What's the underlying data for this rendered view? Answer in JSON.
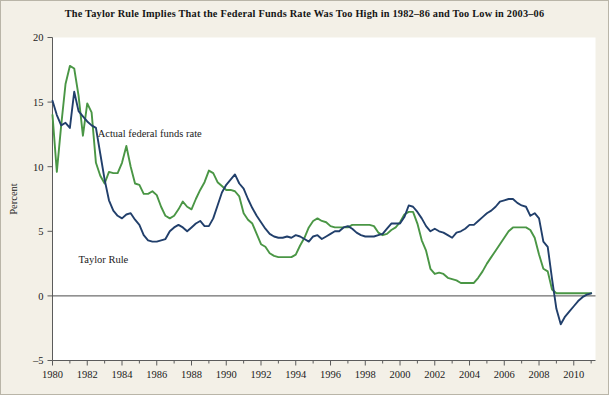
{
  "chart_data": {
    "type": "line",
    "title": "The Taylor Rule Implies That the Federal Funds Rate Was Too High in 1982–86 and Too Low in 2003–06",
    "xlabel": "",
    "ylabel": "Percent",
    "xlim": [
      1980,
      2011.25
    ],
    "ylim": [
      -5,
      20
    ],
    "ytick_values": [
      -5,
      0,
      5,
      10,
      15,
      20
    ],
    "ytick_labels": [
      "–5",
      "0",
      "5",
      "10",
      "15",
      "20"
    ],
    "xtick_values": [
      1980,
      1982,
      1984,
      1986,
      1988,
      1990,
      1992,
      1994,
      1996,
      1998,
      2000,
      2002,
      2004,
      2006,
      2008,
      2010
    ],
    "xtick_labels": [
      "1980",
      "1982",
      "1984",
      "1986",
      "1988",
      "1990",
      "1992",
      "1994",
      "1996",
      "1998",
      "2000",
      "2002",
      "2004",
      "2006",
      "2008",
      "2010"
    ],
    "x_minor_step": 1,
    "grid": false,
    "legend": "inline-annotations",
    "zero_line": true,
    "colors": {
      "actual_federal_funds_rate": "#4a9645",
      "taylor_rule": "#213f6b",
      "axis": "#5b5b5b",
      "background": "#f3f0e7",
      "plot_background": "#ffffff",
      "text": "#1b1b1b"
    },
    "annotations": [
      {
        "name": "actual-series-label",
        "text": "Actual federal funds rate",
        "x": 1982.6,
        "y": 12.3
      },
      {
        "name": "taylor-series-label",
        "text": "Taylor Rule",
        "x": 1981.5,
        "y": 2.55
      }
    ],
    "series": [
      {
        "name": "Actual federal funds rate",
        "color": "#4a9645",
        "x": [
          1980.0,
          1980.25,
          1980.5,
          1980.75,
          1981.0,
          1981.25,
          1981.5,
          1981.75,
          1982.0,
          1982.25,
          1982.5,
          1982.75,
          1983.0,
          1983.25,
          1983.5,
          1983.75,
          1984.0,
          1984.25,
          1984.5,
          1984.75,
          1985.0,
          1985.25,
          1985.5,
          1985.75,
          1986.0,
          1986.25,
          1986.5,
          1986.75,
          1987.0,
          1987.25,
          1987.5,
          1987.75,
          1988.0,
          1988.25,
          1988.5,
          1988.75,
          1989.0,
          1989.25,
          1989.5,
          1989.75,
          1990.0,
          1990.25,
          1990.5,
          1990.75,
          1991.0,
          1991.25,
          1991.5,
          1991.75,
          1992.0,
          1992.25,
          1992.5,
          1992.75,
          1993.0,
          1993.25,
          1993.5,
          1993.75,
          1994.0,
          1994.25,
          1994.5,
          1994.75,
          1995.0,
          1995.25,
          1995.5,
          1995.75,
          1996.0,
          1996.25,
          1996.5,
          1996.75,
          1997.0,
          1997.25,
          1997.5,
          1997.75,
          1998.0,
          1998.25,
          1998.5,
          1998.75,
          1999.0,
          1999.25,
          1999.5,
          1999.75,
          2000.0,
          2000.25,
          2000.5,
          2000.75,
          2001.0,
          2001.25,
          2001.5,
          2001.75,
          2002.0,
          2002.25,
          2002.5,
          2002.75,
          2003.0,
          2003.25,
          2003.5,
          2003.75,
          2004.0,
          2004.25,
          2004.5,
          2004.75,
          2005.0,
          2005.25,
          2005.5,
          2005.75,
          2006.0,
          2006.25,
          2006.5,
          2006.75,
          2007.0,
          2007.25,
          2007.5,
          2007.75,
          2008.0,
          2008.25,
          2008.5,
          2008.75,
          2009.0,
          2009.25,
          2009.5,
          2009.75,
          2010.0,
          2010.25,
          2010.5,
          2010.75,
          2011.0
        ],
        "y": [
          14.0,
          9.6,
          13.2,
          16.4,
          17.8,
          17.6,
          15.5,
          12.4,
          14.9,
          14.2,
          10.3,
          9.3,
          8.7,
          9.6,
          9.5,
          9.5,
          10.3,
          11.6,
          10.0,
          8.7,
          8.6,
          7.9,
          7.9,
          8.1,
          7.8,
          6.9,
          6.2,
          6.0,
          6.2,
          6.7,
          7.3,
          6.9,
          6.7,
          7.5,
          8.2,
          8.8,
          9.7,
          9.5,
          8.8,
          8.5,
          8.2,
          8.2,
          8.1,
          7.7,
          6.4,
          5.9,
          5.6,
          4.8,
          4.0,
          3.8,
          3.3,
          3.1,
          3.0,
          3.0,
          3.0,
          3.0,
          3.2,
          3.9,
          4.5,
          5.3,
          5.8,
          6.0,
          5.8,
          5.7,
          5.4,
          5.3,
          5.3,
          5.3,
          5.3,
          5.5,
          5.5,
          5.5,
          5.5,
          5.5,
          5.4,
          4.9,
          4.7,
          4.8,
          5.1,
          5.3,
          5.7,
          6.3,
          6.5,
          6.5,
          5.6,
          4.3,
          3.5,
          2.1,
          1.7,
          1.8,
          1.7,
          1.4,
          1.3,
          1.2,
          1.0,
          1.0,
          1.0,
          1.0,
          1.4,
          1.9,
          2.5,
          3.0,
          3.5,
          4.0,
          4.5,
          5.0,
          5.3,
          5.3,
          5.3,
          5.3,
          5.1,
          4.5,
          3.2,
          2.1,
          1.9,
          0.5,
          0.2,
          0.2,
          0.2,
          0.2,
          0.2,
          0.2,
          0.2,
          0.2,
          0.2
        ]
      },
      {
        "name": "Taylor Rule",
        "color": "#213f6b",
        "x": [
          1980.0,
          1980.25,
          1980.5,
          1980.75,
          1981.0,
          1981.25,
          1981.5,
          1981.75,
          1982.0,
          1982.25,
          1982.5,
          1982.75,
          1983.0,
          1983.25,
          1983.5,
          1983.75,
          1984.0,
          1984.25,
          1984.5,
          1984.75,
          1985.0,
          1985.25,
          1985.5,
          1985.75,
          1986.0,
          1986.25,
          1986.5,
          1986.75,
          1987.0,
          1987.25,
          1987.5,
          1987.75,
          1988.0,
          1988.25,
          1988.5,
          1988.75,
          1989.0,
          1989.25,
          1989.5,
          1989.75,
          1990.0,
          1990.25,
          1990.5,
          1990.75,
          1991.0,
          1991.25,
          1991.5,
          1991.75,
          1992.0,
          1992.25,
          1992.5,
          1992.75,
          1993.0,
          1993.25,
          1993.5,
          1993.75,
          1994.0,
          1994.25,
          1994.5,
          1994.75,
          1995.0,
          1995.25,
          1995.5,
          1995.75,
          1996.0,
          1996.25,
          1996.5,
          1996.75,
          1997.0,
          1997.25,
          1997.5,
          1997.75,
          1998.0,
          1998.25,
          1998.5,
          1998.75,
          1999.0,
          1999.25,
          1999.5,
          1999.75,
          2000.0,
          2000.25,
          2000.5,
          2000.75,
          2001.0,
          2001.25,
          2001.5,
          2001.75,
          2002.0,
          2002.25,
          2002.5,
          2002.75,
          2003.0,
          2003.25,
          2003.5,
          2003.75,
          2004.0,
          2004.25,
          2004.5,
          2004.75,
          2005.0,
          2005.25,
          2005.5,
          2005.75,
          2006.0,
          2006.25,
          2006.5,
          2006.75,
          2007.0,
          2007.25,
          2007.5,
          2007.75,
          2008.0,
          2008.25,
          2008.5,
          2008.75,
          2009.0,
          2009.25,
          2009.5,
          2009.75,
          2010.0,
          2010.25,
          2010.5,
          2010.75,
          2011.0
        ],
        "y": [
          15.1,
          14.0,
          13.2,
          13.4,
          13.0,
          15.8,
          14.3,
          13.9,
          13.5,
          13.2,
          13.0,
          11.0,
          9.0,
          7.4,
          6.6,
          6.2,
          6.0,
          6.3,
          6.4,
          5.9,
          5.5,
          4.7,
          4.3,
          4.2,
          4.2,
          4.3,
          4.4,
          5.0,
          5.3,
          5.5,
          5.3,
          5.0,
          5.3,
          5.6,
          5.8,
          5.4,
          5.4,
          6.0,
          7.0,
          8.0,
          8.6,
          9.0,
          9.4,
          8.7,
          8.3,
          7.5,
          6.8,
          6.2,
          5.7,
          5.2,
          4.8,
          4.6,
          4.5,
          4.5,
          4.6,
          4.5,
          4.7,
          4.6,
          4.4,
          4.2,
          4.6,
          4.7,
          4.4,
          4.6,
          4.8,
          5.0,
          5.0,
          5.3,
          5.4,
          5.2,
          4.9,
          4.7,
          4.6,
          4.6,
          4.6,
          4.7,
          4.8,
          5.2,
          5.6,
          5.6,
          5.6,
          6.1,
          7.0,
          6.9,
          6.5,
          6.0,
          5.4,
          5.0,
          5.2,
          5.0,
          4.9,
          4.7,
          4.5,
          4.9,
          5.0,
          5.2,
          5.5,
          5.5,
          5.8,
          6.1,
          6.4,
          6.6,
          6.9,
          7.3,
          7.4,
          7.5,
          7.5,
          7.2,
          7.0,
          6.9,
          6.2,
          6.4,
          6.0,
          4.2,
          3.8,
          1.3,
          -1.0,
          -2.2,
          -1.6,
          -1.2,
          -0.8,
          -0.4,
          -0.1,
          0.1,
          0.2
        ]
      }
    ]
  },
  "figure": {
    "ylabel": "Percent"
  }
}
